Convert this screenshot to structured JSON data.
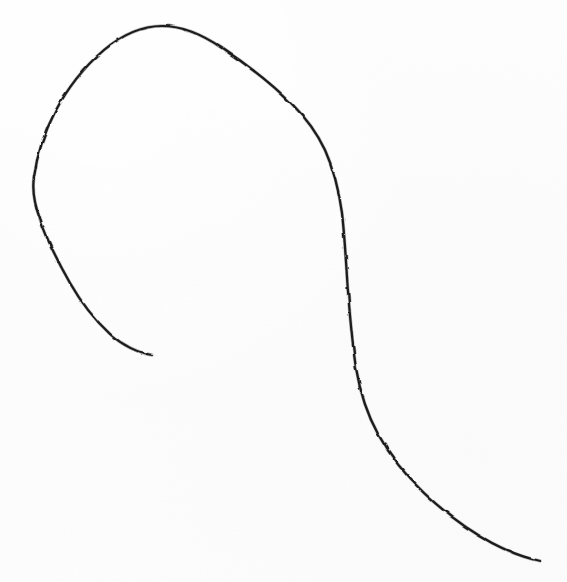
{
  "document": {
    "kind": "scanned-sketch",
    "title": "Hand-drawn curved line on plain paper",
    "description": "A single continuous pencil or ink stroke forming a large open spiral: it rises from a short inner tail in the middle-left, sweeps up and around counter-clockwise over a broad arc at the top, then turns down the right side and sweeps out toward the bottom-right corner.",
    "background_color": "#fdfdfd",
    "ink_color": "#1a1a1a",
    "stroke_width_px": 2.2,
    "width_px": 567,
    "height_px": 582,
    "text_content": "",
    "visible_labels": []
  },
  "chart_data": {
    "type": "line",
    "xlabel": "",
    "ylabel": "",
    "xlim": [
      0,
      567
    ],
    "ylim": [
      0,
      582
    ],
    "grid": false,
    "legend": "none",
    "axes_visible": false,
    "tick_labels": [],
    "annotations": [],
    "series": [
      {
        "name": "spiral-stroke",
        "color": "#1a1a1a",
        "closed": false,
        "start_point": [
          152,
          355
        ],
        "end_point": [
          540,
          561
        ],
        "extrema": {
          "topmost": [
            162,
            26
          ],
          "leftmost": [
            34,
            200
          ],
          "rightmost": [
            540,
            561
          ],
          "bottommost": [
            540,
            561
          ]
        },
        "path_d": "M 152 355 C 138 353 122 345 110 334 C 96 321 82 304 70 283 C 58 262 47 240 40 219 C 34 203 32 190 34 177 C 37 155 44 133 55 112 C 67 89 84 67 104 50 C 122 35 142 26 162 26 C 182 26 203 35 222 48 C 246 64 272 84 292 104 C 306 118 317 133 325 150 C 334 170 339 191 342 213 C 345 239 346 265 348 291 C 350 317 352 343 356 368 C 360 392 367 414 378 434 C 390 456 406 476 424 493 C 444 512 468 530 492 543 C 509 552 526 558 540 561",
        "x": [
          152,
          110,
          70,
          40,
          34,
          55,
          104,
          162,
          222,
          292,
          325,
          342,
          348,
          356,
          378,
          424,
          492,
          540
        ],
        "y": [
          355,
          334,
          283,
          219,
          177,
          112,
          50,
          26,
          48,
          104,
          150,
          213,
          291,
          368,
          434,
          493,
          543,
          561
        ]
      }
    ]
  },
  "accessibility": {
    "alt_text": "A single hand-drawn black curved line on white paper, spiraling from a short tail near the center-left, up around a wide arc at the top, then sweeping down and to the lower-right corner."
  }
}
